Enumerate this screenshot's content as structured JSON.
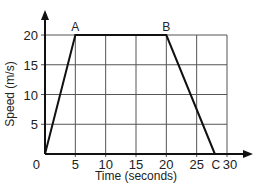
{
  "chart_data": {
    "type": "line",
    "title": "",
    "xlabel": "Time (seconds)",
    "ylabel": "Speed (m/s)",
    "x": [
      0,
      5,
      20,
      28
    ],
    "series": [
      {
        "name": "Speed",
        "values": [
          0,
          20,
          20,
          0
        ]
      }
    ],
    "point_labels": [
      {
        "label": "A",
        "x": 5,
        "y": 20
      },
      {
        "label": "B",
        "x": 20,
        "y": 20
      },
      {
        "label": "C",
        "x": 28,
        "y": 0
      }
    ],
    "x_ticks": [
      "0",
      "5",
      "10",
      "15",
      "20",
      "25",
      "30"
    ],
    "y_ticks": [
      "5",
      "10",
      "15",
      "20"
    ],
    "origin_label": "0",
    "xlim": [
      0,
      30
    ],
    "ylim": [
      0,
      20
    ],
    "grid": true,
    "legend": "none"
  }
}
